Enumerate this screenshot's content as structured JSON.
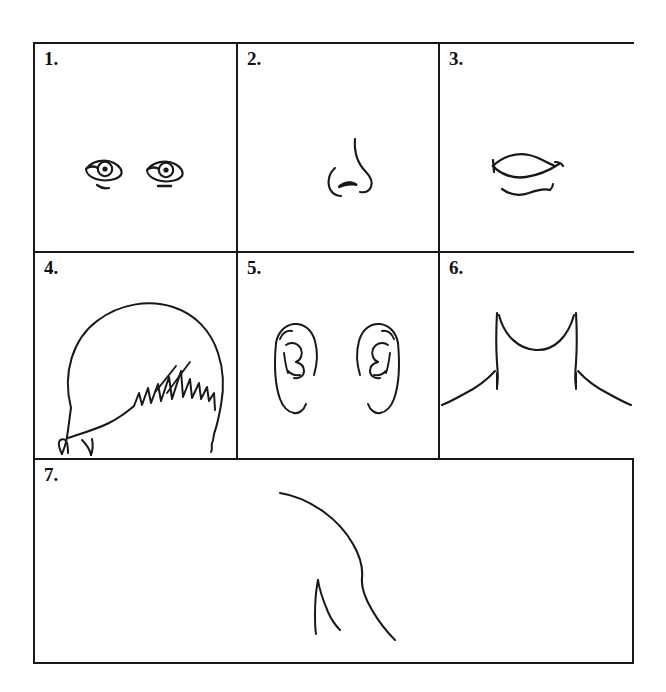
{
  "page": {
    "background_color": "#ffffff",
    "ink_color": "#16181a",
    "border_color": "#16181a"
  },
  "worksheet": {
    "rows": 3,
    "columns": 3,
    "panels": [
      {
        "number": "1.",
        "subject": "eyes",
        "description": "Pair of eyes, almond outlines with round irises and lower lid strokes",
        "row": 1,
        "column": 1
      },
      {
        "number": "2.",
        "subject": "nose",
        "description": "Nose in three-quarter profile with nostril wing and filled nostril",
        "row": 1,
        "column": 2
      },
      {
        "number": "3.",
        "subject": "mouth",
        "description": "Lips with upper lip curve, lip line and separate lower lip",
        "row": 1,
        "column": 3
      },
      {
        "number": "4.",
        "subject": "hair",
        "description": "Head of hair seen from above with jagged spiky fringe",
        "row": 2,
        "column": 1
      },
      {
        "number": "5.",
        "subject": "ears",
        "description": "Pair of ears with helix outline and inner antihelix folds",
        "row": 2,
        "column": 2
      },
      {
        "number": "6.",
        "subject": "neck-and-shoulders",
        "description": "Neck curving into sloping shoulders",
        "row": 2,
        "column": 3
      },
      {
        "number": "7.",
        "subject": "arm-and-torso",
        "description": "Shoulder and arm contour with a short angled crease mark",
        "row": 3,
        "column": 1
      }
    ]
  }
}
